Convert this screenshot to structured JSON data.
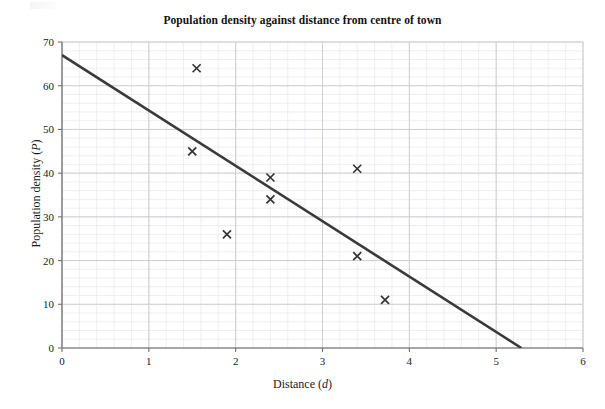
{
  "chart_data": {
    "type": "scatter",
    "title": "Population density against distance from centre of town",
    "xlabel": "Distance (d)",
    "xlabel_text": "Distance (",
    "xlabel_var": "d",
    "xlabel_tail": ")",
    "ylabel": "Population density (P)",
    "ylabel_text": "Population density (",
    "ylabel_var": "P",
    "ylabel_tail": ")",
    "xlim": [
      0,
      6
    ],
    "ylim": [
      0,
      70
    ],
    "xticks": [
      0,
      1,
      2,
      3,
      4,
      5,
      6
    ],
    "yticks": [
      0,
      10,
      20,
      30,
      40,
      50,
      60,
      70
    ],
    "xtick_labels": [
      "0",
      "1",
      "2",
      "3",
      "4",
      "5",
      "6"
    ],
    "ytick_labels": [
      "0",
      "10",
      "20",
      "30",
      "40",
      "50",
      "60",
      "70"
    ],
    "grid": true,
    "minor_grid": true,
    "minor_divisions": 5,
    "legend": "none",
    "marker": "x",
    "marker_color": "#333333",
    "points": [
      {
        "x": 1.55,
        "y": 64
      },
      {
        "x": 1.5,
        "y": 45
      },
      {
        "x": 1.9,
        "y": 26
      },
      {
        "x": 2.4,
        "y": 39
      },
      {
        "x": 2.4,
        "y": 34
      },
      {
        "x": 3.4,
        "y": 41
      },
      {
        "x": 3.4,
        "y": 21
      },
      {
        "x": 3.72,
        "y": 11
      }
    ],
    "series": [
      {
        "name": "line of best fit",
        "type": "line",
        "color": "#3a3a3a",
        "x": [
          0,
          5.29
        ],
        "values": [
          67,
          0
        ]
      }
    ],
    "annotations": []
  },
  "colors": {
    "axis": "#6f6f6f",
    "major_grid": "#c9c9cf",
    "minor_grid": "#e6e6ec",
    "line": "#3a3a3a",
    "marker": "#333333",
    "text": "#1a1a1a",
    "background": "#ffffff"
  }
}
